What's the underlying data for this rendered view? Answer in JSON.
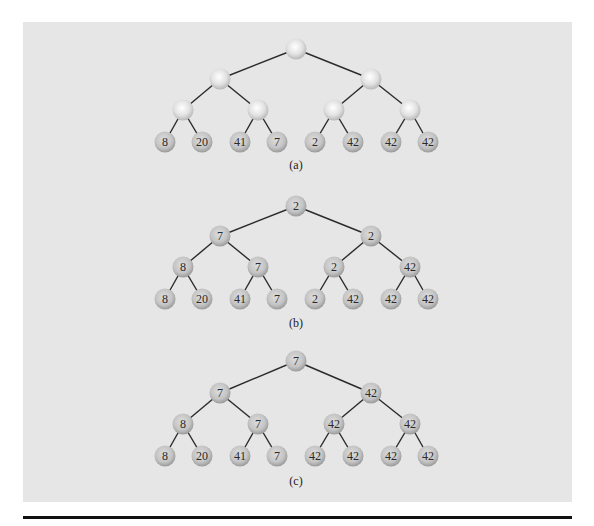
{
  "colors": {
    "background": "#ffffff",
    "panel": "#e6e6e6",
    "rule": "#111111",
    "edge": "#2b2b2b",
    "node_fill_empty_center": "#ffffff",
    "node_fill_empty_rim": "#b8b8b8",
    "node_fill_filled_center": "#d9d9d9",
    "node_fill_filled_rim": "#9a9a9a",
    "label": "#2a2a2a"
  },
  "layout": {
    "x_levels": {
      "root": [
        296
      ],
      "level1": [
        220,
        371
      ],
      "level2": [
        183,
        258,
        334,
        410
      ],
      "leaves": [
        165,
        202,
        240,
        277,
        315,
        353,
        391,
        428
      ]
    }
  },
  "trees": [
    {
      "id": "a",
      "caption": "(a)",
      "caption_y": 158,
      "y": [
        49,
        79,
        110,
        142
      ],
      "root": [
        ""
      ],
      "level1": [
        "",
        ""
      ],
      "level2": [
        "",
        "",
        "",
        ""
      ],
      "leaves": [
        "8",
        "20",
        "41",
        "7",
        "2",
        "42",
        "42",
        "42"
      ]
    },
    {
      "id": "b",
      "caption": "(b)",
      "caption_y": 316,
      "y": [
        206,
        236,
        267,
        299
      ],
      "root": [
        "2"
      ],
      "level1": [
        "7",
        "2"
      ],
      "level2": [
        "8",
        "7",
        "2",
        "42"
      ],
      "leaves": [
        "8",
        "20",
        "41",
        "7",
        "2",
        "42",
        "42",
        "42"
      ]
    },
    {
      "id": "c",
      "caption": "(c)",
      "caption_y": 474,
      "y": [
        361,
        393,
        424,
        456
      ],
      "root": [
        "7"
      ],
      "level1": [
        "7",
        "42"
      ],
      "level2": [
        "8",
        "7",
        "42",
        "42"
      ],
      "leaves": [
        "8",
        "20",
        "41",
        "7",
        "42",
        "42",
        "42",
        "42"
      ]
    }
  ]
}
